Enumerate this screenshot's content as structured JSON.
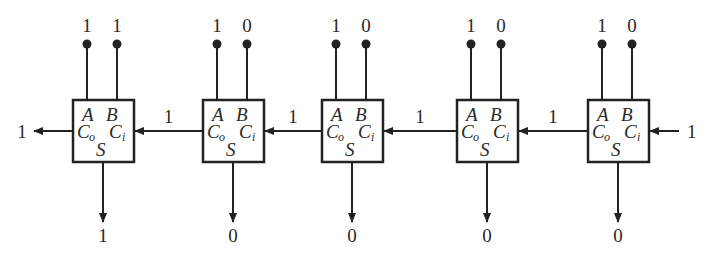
{
  "diagram": {
    "adders": [
      {
        "x": 73,
        "a": "1",
        "b": "1",
        "sum": "1",
        "labels": {
          "a": "A",
          "b": "B",
          "co": "C",
          "co_sub": "o",
          "ci": "C",
          "ci_sub": "i",
          "s": "S"
        }
      },
      {
        "x": 203,
        "a": "1",
        "b": "0",
        "sum": "0",
        "labels": {
          "a": "A",
          "b": "B",
          "co": "C",
          "co_sub": "o",
          "ci": "C",
          "ci_sub": "i",
          "s": "S"
        }
      },
      {
        "x": 322,
        "a": "1",
        "b": "0",
        "sum": "0",
        "labels": {
          "a": "A",
          "b": "B",
          "co": "C",
          "co_sub": "o",
          "ci": "C",
          "ci_sub": "i",
          "s": "S"
        }
      },
      {
        "x": 457,
        "a": "1",
        "b": "0",
        "sum": "0",
        "labels": {
          "a": "A",
          "b": "B",
          "co": "C",
          "co_sub": "o",
          "ci": "C",
          "ci_sub": "i",
          "s": "S"
        }
      },
      {
        "x": 588,
        "a": "1",
        "b": "0",
        "sum": "0",
        "labels": {
          "a": "A",
          "b": "B",
          "co": "C",
          "co_sub": "o",
          "ci": "C",
          "ci_sub": "i",
          "s": "S"
        }
      }
    ],
    "carries": [
      "1",
      "1",
      "1",
      "1"
    ],
    "carry_in": "1",
    "carry_out": "1"
  }
}
